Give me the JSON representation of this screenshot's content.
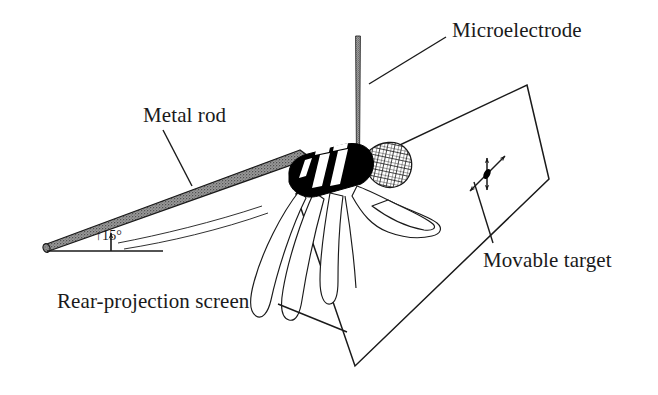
{
  "figure": {
    "kind": "experimental-setup-schematic",
    "background_color": "#ffffff",
    "ink_color": "#1a1a1a"
  },
  "labels": {
    "microelectrode": "Microelectrode",
    "metal_rod": "Metal rod",
    "movable_target": "Movable target",
    "rear_projection_screen": "Rear-projection screen",
    "rod_angle": "15°",
    "rod_angle_arrow": "↑"
  },
  "parts": {
    "microelectrode": {
      "name": "microelectrode-needle",
      "description": "thin vertical stippled needle descending to the hand",
      "color": "#7a7a7a"
    },
    "metal_rod": {
      "name": "metal-rod",
      "description": "tapered stippled bar inclined upward to the right at 15 degrees",
      "color": "#8c8c8c",
      "incline_degrees": 15
    },
    "hand": {
      "name": "monkey-hand",
      "description": "black filled hand gripping the rod with white highlight stripes and fingers drawn in outline",
      "fill": "#000000",
      "highlight": "#ffffff"
    },
    "wrist_cuff": {
      "name": "wrist-cuff",
      "description": "cross-hatched cuff around the wrist",
      "pattern": "cross-hatch"
    },
    "screen": {
      "name": "rear-projection-screen",
      "description": "tilted quadrilateral panel drawn in outline behind the hand",
      "stroke": "#1a1a1a"
    },
    "target": {
      "name": "movable-target-dot",
      "description": "small black target spot with vertical and diagonal double-headed arrows showing it can move",
      "fill": "#000000",
      "arrows": [
        "vertical-double-arrow",
        "diagonal-double-arrow"
      ]
    }
  }
}
